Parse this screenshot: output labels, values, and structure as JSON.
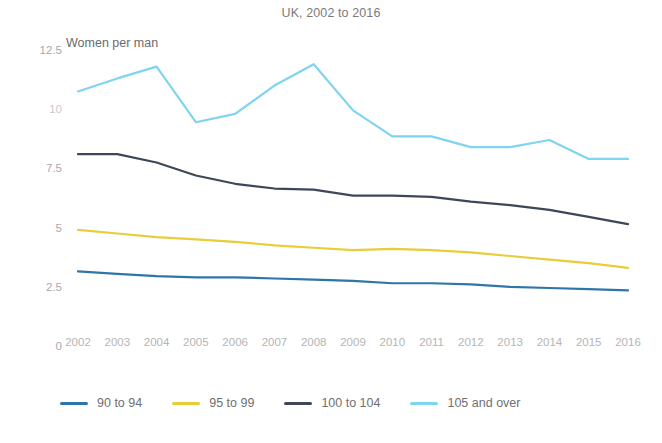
{
  "chart_data": {
    "type": "line",
    "title": "UK, 2002 to 2016",
    "ylabel": "Women per man",
    "xlabel": "",
    "ylim": [
      0,
      12.5
    ],
    "yticks": [
      0,
      2.5,
      5,
      7.5,
      10,
      12.5
    ],
    "ytick_labels": [
      "0",
      "2.5",
      "5",
      "7.5",
      "10",
      "12.5"
    ],
    "grid": false,
    "legend_position": "bottom-left",
    "categories": [
      2002,
      2003,
      2004,
      2005,
      2006,
      2007,
      2008,
      2009,
      2010,
      2011,
      2012,
      2013,
      2014,
      2015,
      2016
    ],
    "x": [
      "2002",
      "2003",
      "2004",
      "2005",
      "2006",
      "2007",
      "2008",
      "2009",
      "2010",
      "2011",
      "2012",
      "2013",
      "2014",
      "2015",
      "2016"
    ],
    "series": [
      {
        "name": "90 to 94",
        "color": "#2e75a8",
        "values": [
          3.15,
          3.05,
          2.95,
          2.9,
          2.9,
          2.85,
          2.8,
          2.75,
          2.65,
          2.65,
          2.6,
          2.5,
          2.45,
          2.4,
          2.35
        ]
      },
      {
        "name": "95 to 99",
        "color": "#e8cd3a",
        "values": [
          4.9,
          4.75,
          4.6,
          4.5,
          4.4,
          4.25,
          4.15,
          4.05,
          4.1,
          4.05,
          3.95,
          3.8,
          3.65,
          3.5,
          3.3
        ]
      },
      {
        "name": "100 to 104",
        "color": "#3d4758",
        "values": [
          8.1,
          8.1,
          7.75,
          7.2,
          6.85,
          6.65,
          6.6,
          6.35,
          6.35,
          6.3,
          6.1,
          5.95,
          5.75,
          5.45,
          5.15
        ]
      },
      {
        "name": "105 and over",
        "color": "#7fd4ef",
        "values": [
          10.75,
          11.3,
          11.8,
          9.45,
          9.8,
          11.0,
          11.9,
          9.95,
          8.85,
          8.85,
          8.4,
          8.4,
          8.7,
          7.9,
          7.9
        ]
      }
    ]
  },
  "legend": {
    "items": [
      {
        "label": "90 to 94",
        "color": "#2e75a8"
      },
      {
        "label": "95 to 99",
        "color": "#e8cd3a"
      },
      {
        "label": "100 to 104",
        "color": "#3d4758"
      },
      {
        "label": "105 and over",
        "color": "#7fd4ef"
      }
    ]
  },
  "colors": {
    "background": "#ffffff",
    "title_text": "#7a7a7a",
    "axis_text": "#b0b0b0",
    "caption_text": "#6b6b6b"
  }
}
